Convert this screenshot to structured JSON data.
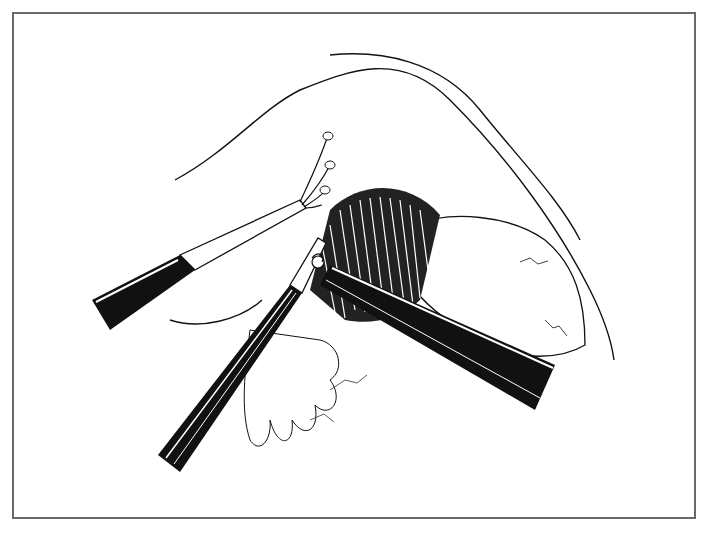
{
  "figure": {
    "type": "surgical line illustration",
    "style": "black-and-white pen drawing",
    "frame_color": "#6a6a6a",
    "ink_color": "#111111",
    "background": "#ffffff",
    "elements": [
      "retractor-fan-instrument",
      "grasping-forceps-lower-left",
      "dissecting-instrument-right",
      "muscle-fibers",
      "organ-surface",
      "fatty-tissue",
      "skin-contour"
    ]
  }
}
